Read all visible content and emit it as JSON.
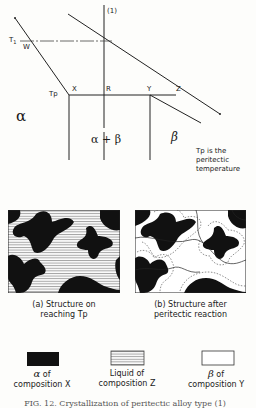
{
  "diagram": {
    "labels": {
      "alloy": "(1)",
      "t1": "T",
      "t1_sub": "1",
      "w": "W",
      "tp": "Tp",
      "x": "X",
      "r": "R",
      "y": "Y",
      "z": "Z",
      "alpha": "α",
      "alpha_plus_beta": "α + β",
      "beta": "β"
    },
    "note": [
      "Tp is the",
      "peritectic",
      "temperature"
    ]
  },
  "microstructures": [
    {
      "caption_line1": "(a)  Structure on",
      "caption_line2": "reaching Tp"
    },
    {
      "caption_line1": "(b)  Structure after",
      "caption_line2": "peritectic reaction"
    }
  ],
  "legend": [
    {
      "symbol": "α",
      "line1": "of",
      "line2": "composition X",
      "fill": "#111111"
    },
    {
      "symbol": "",
      "line1": "Liquid  of",
      "line2": "composition Z",
      "fill": "striped"
    },
    {
      "symbol": "β",
      "line1": "of",
      "line2": "composition Y",
      "fill": "#ffffff"
    }
  ],
  "figure_caption": "FIG. 12.  Crystallization of peritectic alloy type (1)"
}
